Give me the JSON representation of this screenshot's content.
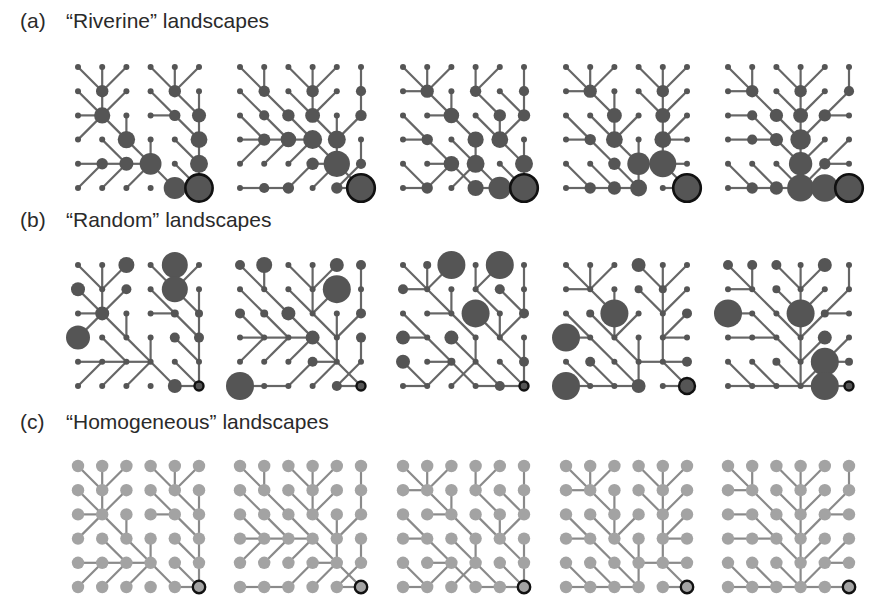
{
  "figure": {
    "rows": [
      {
        "tag": "(a)",
        "title": "“Riverine” landscapes",
        "label_y": 22,
        "origin_y": 67,
        "style": "accumulated",
        "node_color": "#555555",
        "edge_color": "#666666"
      },
      {
        "tag": "(b)",
        "title": "“Random” landscapes",
        "label_y": 221,
        "origin_y": 265,
        "style": "random",
        "node_color": "#555555",
        "edge_color": "#666666"
      },
      {
        "tag": "(c)",
        "title": "“Homogeneous” landscapes",
        "label_y": 423,
        "origin_y": 466,
        "style": "uniform",
        "node_color": "#a3a3a3",
        "edge_color": "#8a8a8a"
      }
    ],
    "panel_origins_x": [
      78,
      240,
      403,
      566,
      728
    ],
    "grid": {
      "size": 6,
      "spacing": 24.2
    },
    "outlet": {
      "col": 5,
      "row": 5,
      "ring_color": "#111111"
    },
    "direction_legend": {
      "R": "right",
      "L": "left",
      "D": "down",
      "U": "up",
      "E": "down-right",
      "W": "down-left",
      "Q": "up-right",
      "O": "outlet"
    },
    "topologies": [
      [
        "EDWEDW",
        "EDWEED",
        "REDRED",
        "QEEDED",
        "RRREED",
        "QQQERO"
      ],
      [
        "EDEDWD",
        "EEEDWD",
        "EEEEDW",
        "RRREDD",
        "QQQREW",
        "RRQQRO"
      ],
      [
        "EDWDWD",
        "REDEED",
        "EREEDW",
        "REEDED",
        "EREEED",
        "RQQRRO"
      ],
      [
        "EDWEDW",
        "REDEDW",
        "EEDWDW",
        "REEDDL",
        "EEEREL",
        "RRRURO"
      ],
      [
        "EDEDWD",
        "REEDWW",
        "REEDWL",
        "RREDWW",
        "EEEDWL",
        "RRRRRO"
      ]
    ],
    "random_radii": [
      {
        "2,0": 8,
        "4,0": 13,
        "0,1": 7,
        "2,1": 5,
        "4,1": 13,
        "1,2": 7,
        "4,2": 4,
        "5,2": 4,
        "0,3": 12,
        "4,3": 5,
        "5,3": 5,
        "4,5": 7,
        "5,5": 4
      },
      {
        "0,0": 5,
        "1,0": 8,
        "4,0": 7,
        "5,0": 5,
        "4,1": 14,
        "0,2": 5,
        "1,2": 4,
        "2,2": 7,
        "5,2": 5,
        "3,3": 7,
        "5,3": 5,
        "3,4": 5,
        "0,5": 14,
        "4,5": 5,
        "5,5": 4
      },
      {
        "1,0": 4,
        "2,0": 14,
        "4,0": 14,
        "0,1": 5,
        "4,1": 5,
        "3,2": 14,
        "5,2": 5,
        "0,3": 7,
        "2,3": 7,
        "0,4": 7,
        "2,4": 4,
        "5,4": 5,
        "4,5": 5,
        "5,5": 3
      },
      {
        "3,0": 7,
        "3,1": 4,
        "4,1": 4,
        "1,2": 4,
        "2,2": 14,
        "5,2": 5,
        "0,3": 14,
        "1,4": 5,
        "5,4": 5,
        "0,5": 14,
        "3,5": 7,
        "5,5": 8
      },
      {
        "0,0": 5,
        "1,0": 5,
        "2,0": 5,
        "4,0": 7,
        "2,1": 4,
        "0,2": 14,
        "3,2": 14,
        "4,2": 4,
        "4,3": 7,
        "2,4": 4,
        "4,4": 14,
        "5,4": 4,
        "4,5": 14,
        "5,5": 3
      }
    ]
  }
}
